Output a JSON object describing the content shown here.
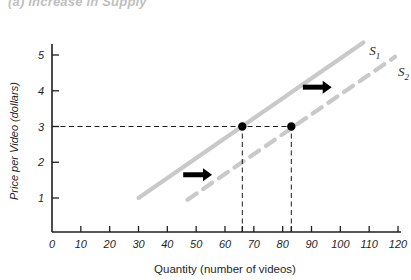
{
  "figure": {
    "partial_top_title": "(a)  Increase in Supply",
    "background_color": "#ffffff"
  },
  "chart_data": {
    "type": "line",
    "title": "",
    "xlabel": "Quantity (number of videos)",
    "ylabel": "Price per Video (dollars)",
    "xlim": [
      0,
      120
    ],
    "ylim": [
      0,
      5.6
    ],
    "grid": false,
    "legend": "inline-curve-labels",
    "xticks": [
      0,
      10,
      20,
      30,
      40,
      50,
      60,
      70,
      80,
      90,
      100,
      110,
      120
    ],
    "xticklabels": [
      "0",
      "10",
      "20",
      "30",
      "40",
      "50",
      "60",
      "70",
      "80",
      "90",
      "100",
      "110",
      "120"
    ],
    "yticks": [
      1,
      2,
      3,
      4,
      5
    ],
    "yticklabels": [
      "1",
      "2",
      "3",
      "4",
      "5"
    ],
    "extra_xticks": [
      66,
      83
    ],
    "series": [
      {
        "name": "S1",
        "label": "S",
        "subscript": "1",
        "style": "solid",
        "color": "#c9c9c9",
        "x": [
          30,
          108
        ],
        "y": [
          1.0,
          5.35
        ],
        "label_x": 110,
        "label_y": 5.0
      },
      {
        "name": "S2",
        "label": "S",
        "subscript": "2",
        "style": "dashed",
        "color": "#c9c9c9",
        "x": [
          47,
          119
        ],
        "y": [
          0.95,
          4.95
        ],
        "label_x": 120,
        "label_y": 4.4
      }
    ],
    "points": [
      {
        "name": "equilibrium-1",
        "x": 66,
        "y": 3,
        "color": "#000000"
      },
      {
        "name": "equilibrium-2",
        "x": 83,
        "y": 3,
        "color": "#000000"
      }
    ],
    "guide_lines": [
      {
        "name": "price-guide-horizontal",
        "orientation": "horizontal",
        "value": 3,
        "from": 0,
        "to": 83
      },
      {
        "name": "quantity-guide-1",
        "orientation": "vertical",
        "value": 66,
        "from": 0,
        "to": 3
      },
      {
        "name": "quantity-guide-2",
        "orientation": "vertical",
        "value": 83,
        "from": 0,
        "to": 3
      }
    ],
    "annotations": [
      {
        "name": "shift-arrow-lower",
        "type": "arrow",
        "direction": "right",
        "x_start": 45.5,
        "x_end": 55.5,
        "y": 1.65
      },
      {
        "name": "shift-arrow-upper",
        "type": "arrow",
        "direction": "right",
        "x_start": 87,
        "x_end": 97,
        "y": 4.1
      }
    ]
  }
}
